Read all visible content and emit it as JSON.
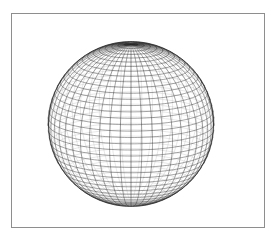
{
  "window": {
    "title": "",
    "background_color": "#ffffff"
  },
  "plot": {
    "name": "wireframe-sphere-plot",
    "frame": {
      "border_color": "#8e8e8e",
      "background_color": "#ffffff",
      "x": 11,
      "y": 13,
      "width": 254,
      "height": 215
    },
    "caption": "",
    "axis_labels": [],
    "tick_labels": []
  },
  "chart_data": {
    "type": "scatter",
    "title": "",
    "subtitle": "",
    "xlabel": "",
    "ylabel": "",
    "grid": true,
    "legend": [],
    "annotations": [],
    "geometry": {
      "shape": "sphere-wireframe",
      "projection": "orthographic",
      "center_x": 130,
      "center_y": 123,
      "radius": 82,
      "radius_x": 83,
      "radius_y": 82,
      "meridian_count": 48,
      "parallel_count": 40,
      "tilt_degrees": 14,
      "rotation_degrees": 0,
      "line_color": "#2a2a2a",
      "hidden_line_color": "#b9b9b9",
      "silhouette_color": "#1a1a1a",
      "hidden_lines_visible": true,
      "fill": "none"
    },
    "x": [],
    "values": [],
    "xlim": [
      -1,
      1
    ],
    "ylim": [
      -1,
      1
    ]
  }
}
